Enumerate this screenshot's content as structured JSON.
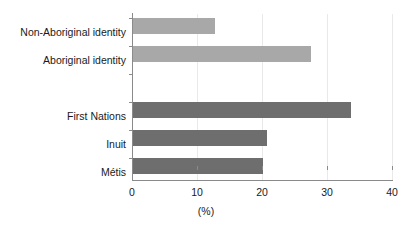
{
  "chart_data": {
    "type": "bar",
    "orientation": "horizontal",
    "title": "",
    "subtitle": "",
    "xlabel": "(%)",
    "ylabel": "",
    "xlim": [
      0,
      40
    ],
    "xticks": [
      0,
      10,
      20,
      30,
      40
    ],
    "xtick_labels": [
      "0",
      "10",
      "20",
      "30",
      "40"
    ],
    "grid": true,
    "grid_axis": "x",
    "legend": "none",
    "categories": [
      "Non-Aboriginal identity",
      "Aboriginal identity",
      "First Nations",
      "Inuit",
      "Métis"
    ],
    "values": [
      12.7,
      27.5,
      33.7,
      20.7,
      20.1
    ],
    "bars": [
      {
        "label": "Non-Aboriginal identity",
        "value": 12.7,
        "color": "#a8a8a8",
        "group": "identity",
        "row": 0
      },
      {
        "label": "Aboriginal identity",
        "value": 27.5,
        "color": "#a8a8a8",
        "group": "identity",
        "row": 1
      },
      {
        "label": "First Nations",
        "value": 33.7,
        "color": "#6e6e6e",
        "group": "aboriginal-group",
        "row": 3
      },
      {
        "label": "Inuit",
        "value": 20.7,
        "color": "#6e6e6e",
        "group": "aboriginal-group",
        "row": 4
      },
      {
        "label": "Métis",
        "value": 20.1,
        "color": "#6e6e6e",
        "group": "aboriginal-group",
        "row": 5
      }
    ],
    "colors": {
      "identity_bars": "#a8a8a8",
      "group_bars": "#6e6e6e",
      "axis": "#8a8a8a",
      "gridline": "#e9e9e9",
      "background": "#ffffff"
    }
  }
}
